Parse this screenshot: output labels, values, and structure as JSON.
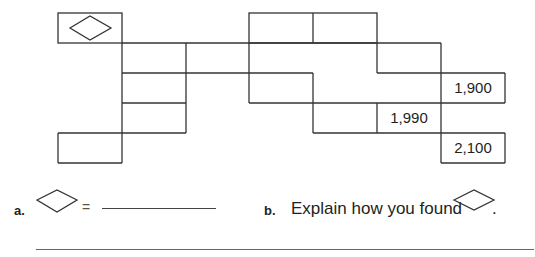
{
  "puzzle": {
    "unknown_symbol": "diamond",
    "given_values": [
      {
        "position": "row2-col6",
        "value": "1,900"
      },
      {
        "position": "row3-col5",
        "value": "1,990"
      },
      {
        "position": "row4-col6",
        "value": "2,100"
      }
    ]
  },
  "questions": {
    "a": {
      "label": "a.",
      "equals": "=",
      "blank": ""
    },
    "b": {
      "label": "b.",
      "text": "Explain how you found",
      "period": "."
    }
  },
  "answer_line": ""
}
